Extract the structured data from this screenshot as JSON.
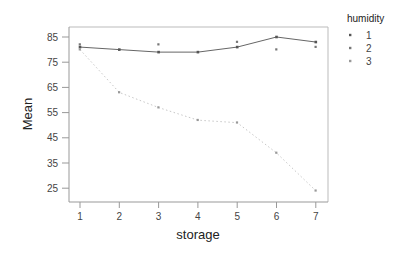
{
  "chart_data": {
    "type": "line",
    "title": "",
    "xlabel": "storage",
    "ylabel": "Mean",
    "x": [
      1,
      2,
      3,
      4,
      5,
      6,
      7
    ],
    "x_ticks": [
      "1",
      "2",
      "3",
      "4",
      "5",
      "6",
      "7"
    ],
    "y_ticks": [
      "85",
      "75",
      "65",
      "55",
      "45",
      "35",
      "25"
    ],
    "ylim": [
      21,
      87
    ],
    "grid": false,
    "legend_position": "right",
    "legend_title": "humidity",
    "series": [
      {
        "name": "1",
        "values": [
          81,
          80,
          79,
          79,
          81,
          85,
          83
        ],
        "line": "solid",
        "color": "#555555"
      },
      {
        "name": "2",
        "values": [
          82,
          null,
          82,
          null,
          83,
          80,
          81
        ],
        "line": "none",
        "color": "#777777"
      },
      {
        "name": "3",
        "values": [
          80,
          63,
          57,
          52,
          51,
          39,
          24
        ],
        "line": "dotted",
        "color": "#999999"
      }
    ]
  },
  "legend": {
    "title": "humidity",
    "items": [
      "1",
      "2",
      "3"
    ]
  },
  "axes": {
    "x_title": "storage",
    "y_title": "Mean"
  }
}
